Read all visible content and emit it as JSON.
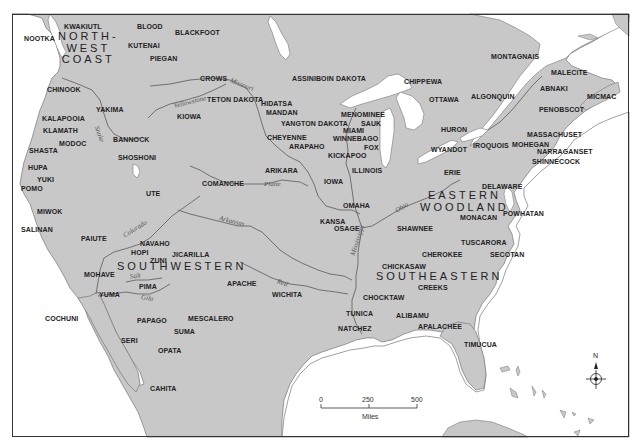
{
  "map": {
    "colors": {
      "land": "#c8c8c8",
      "water": "#ffffff",
      "border": "#333333",
      "river": "#555555",
      "text": "#222222"
    },
    "regions": [
      {
        "id": "northwest-coast",
        "lines": [
          "NORTH-",
          "WEST",
          "COAST"
        ],
        "x": 58,
        "y": 31
      },
      {
        "id": "southwestern",
        "lines": [
          "SOUTHWESTERN"
        ],
        "x": 117,
        "y": 261
      },
      {
        "id": "eastern-woodland",
        "lines": [
          "EASTERN",
          "WOODLAND"
        ],
        "x": 420,
        "y": 190
      },
      {
        "id": "southeastern",
        "lines": [
          "SOUTHEASTERN"
        ],
        "x": 376,
        "y": 271
      }
    ],
    "tribes": [
      {
        "name": "NOOTKA",
        "x": 24,
        "y": 35
      },
      {
        "name": "KWAKIUTL",
        "x": 64,
        "y": 23
      },
      {
        "name": "BLOOD",
        "x": 137,
        "y": 23
      },
      {
        "name": "BLACKFOOT",
        "x": 175,
        "y": 29
      },
      {
        "name": "KUTENAI",
        "x": 128,
        "y": 42
      },
      {
        "name": "PIEGAN",
        "x": 150,
        "y": 55
      },
      {
        "name": "CHINOOK",
        "x": 47,
        "y": 86
      },
      {
        "name": "CROWS",
        "x": 200,
        "y": 75
      },
      {
        "name": "YAKIMA",
        "x": 96,
        "y": 106
      },
      {
        "name": "KIOWA",
        "x": 177,
        "y": 113
      },
      {
        "name": "KALAPOOIA",
        "x": 42,
        "y": 115
      },
      {
        "name": "KLAMATH",
        "x": 43,
        "y": 127
      },
      {
        "name": "BANNOCK",
        "x": 113,
        "y": 136
      },
      {
        "name": "MODOC",
        "x": 59,
        "y": 140
      },
      {
        "name": "SHASTA",
        "x": 29,
        "y": 147
      },
      {
        "name": "SHOSHONI",
        "x": 118,
        "y": 154
      },
      {
        "name": "HUPA",
        "x": 28,
        "y": 164
      },
      {
        "name": "YUKI",
        "x": 37,
        "y": 176
      },
      {
        "name": "POMO",
        "x": 21,
        "y": 185
      },
      {
        "name": "UTE",
        "x": 146,
        "y": 190
      },
      {
        "name": "MIWOK",
        "x": 37,
        "y": 208
      },
      {
        "name": "SALINAN",
        "x": 21,
        "y": 226
      },
      {
        "name": "PAIUTE",
        "x": 81,
        "y": 235
      },
      {
        "name": "NAVAHO",
        "x": 140,
        "y": 240
      },
      {
        "name": "HOPI",
        "x": 131,
        "y": 249
      },
      {
        "name": "JICARILLA",
        "x": 172,
        "y": 251
      },
      {
        "name": "ZUNI",
        "x": 150,
        "y": 257
      },
      {
        "name": "MOHAVE",
        "x": 84,
        "y": 271
      },
      {
        "name": "PIMA",
        "x": 139,
        "y": 283
      },
      {
        "name": "YUMA",
        "x": 99,
        "y": 291
      },
      {
        "name": "COCHUNI",
        "x": 45,
        "y": 315
      },
      {
        "name": "PAPAGO",
        "x": 137,
        "y": 317
      },
      {
        "name": "SUMA",
        "x": 174,
        "y": 328
      },
      {
        "name": "SERI",
        "x": 121,
        "y": 337
      },
      {
        "name": "OPATA",
        "x": 158,
        "y": 347
      },
      {
        "name": "CAHITA",
        "x": 150,
        "y": 385
      },
      {
        "name": "MESCALERO",
        "x": 188,
        "y": 315
      },
      {
        "name": "APACHE",
        "x": 227,
        "y": 280
      },
      {
        "name": "WICHITA",
        "x": 272,
        "y": 291
      },
      {
        "name": "TETON DAKOTA",
        "x": 207,
        "y": 96
      },
      {
        "name": "ASSINIBOIN DAKOTA",
        "x": 292,
        "y": 75
      },
      {
        "name": "HIDATSA",
        "x": 261,
        "y": 100
      },
      {
        "name": "MANDAN",
        "x": 266,
        "y": 109
      },
      {
        "name": "CHEYENNE",
        "x": 267,
        "y": 134
      },
      {
        "name": "YANGTON DAKOTA",
        "x": 281,
        "y": 120
      },
      {
        "name": "ARAPAHO",
        "x": 289,
        "y": 143
      },
      {
        "name": "ARIKARA",
        "x": 265,
        "y": 167
      },
      {
        "name": "COMANCHE",
        "x": 202,
        "y": 180
      },
      {
        "name": "IOWA",
        "x": 324,
        "y": 178
      },
      {
        "name": "KICKAPOO",
        "x": 328,
        "y": 152
      },
      {
        "name": "ILLINOIS",
        "x": 352,
        "y": 167
      },
      {
        "name": "OMAHA",
        "x": 343,
        "y": 202
      },
      {
        "name": "KANSA",
        "x": 320,
        "y": 218
      },
      {
        "name": "OSAGE",
        "x": 334,
        "y": 225
      },
      {
        "name": "MENOMINEE",
        "x": 341,
        "y": 111
      },
      {
        "name": "SAUK",
        "x": 361,
        "y": 120
      },
      {
        "name": "MIAMI",
        "x": 343,
        "y": 127
      },
      {
        "name": "WINNEBAGO",
        "x": 333,
        "y": 135
      },
      {
        "name": "FOX",
        "x": 364,
        "y": 144
      },
      {
        "name": "CHIPPEWA",
        "x": 404,
        "y": 78
      },
      {
        "name": "OTTAWA",
        "x": 429,
        "y": 96
      },
      {
        "name": "HURON",
        "x": 441,
        "y": 126
      },
      {
        "name": "WYANDOT",
        "x": 431,
        "y": 146
      },
      {
        "name": "ERIE",
        "x": 444,
        "y": 169
      },
      {
        "name": "IROQUOIS",
        "x": 473,
        "y": 142
      },
      {
        "name": "ALGONQUIN",
        "x": 471,
        "y": 93
      },
      {
        "name": "MONTAGNAIS",
        "x": 491,
        "y": 53
      },
      {
        "name": "MALECITE",
        "x": 551,
        "y": 69
      },
      {
        "name": "ABNAKI",
        "x": 540,
        "y": 85
      },
      {
        "name": "MICMAC",
        "x": 587,
        "y": 93
      },
      {
        "name": "PENOBSCOT",
        "x": 539,
        "y": 106
      },
      {
        "name": "MASSACHUSET",
        "x": 527,
        "y": 131
      },
      {
        "name": "MOHEGAN",
        "x": 512,
        "y": 141
      },
      {
        "name": "NARRAGANSET",
        "x": 537,
        "y": 148
      },
      {
        "name": "SHINNECOCK",
        "x": 532,
        "y": 158
      },
      {
        "name": "DELAWARE",
        "x": 482,
        "y": 183
      },
      {
        "name": "POWHATAN",
        "x": 503,
        "y": 210
      },
      {
        "name": "MONACAN",
        "x": 460,
        "y": 214
      },
      {
        "name": "SHAWNEE",
        "x": 397,
        "y": 225
      },
      {
        "name": "TUSCARORA",
        "x": 461,
        "y": 239
      },
      {
        "name": "CHEROKEE",
        "x": 422,
        "y": 251
      },
      {
        "name": "SECOTAN",
        "x": 490,
        "y": 251
      },
      {
        "name": "CHICKASAW",
        "x": 382,
        "y": 263
      },
      {
        "name": "CREEKS",
        "x": 418,
        "y": 284
      },
      {
        "name": "CHOCKTAW",
        "x": 363,
        "y": 294
      },
      {
        "name": "TUNICA",
        "x": 346,
        "y": 310
      },
      {
        "name": "ALIBAMU",
        "x": 396,
        "y": 312
      },
      {
        "name": "APALACHEE",
        "x": 418,
        "y": 323
      },
      {
        "name": "NATCHEZ",
        "x": 338,
        "y": 325
      },
      {
        "name": "TIMUCUA",
        "x": 464,
        "y": 341
      }
    ],
    "rivers": [
      {
        "name": "Missouri",
        "x": 230,
        "y": 77,
        "rotate": 22
      },
      {
        "name": "Yellowstone",
        "x": 174,
        "y": 103,
        "rotate": -14
      },
      {
        "name": "Snake",
        "x": 96,
        "y": 123,
        "rotate": 70
      },
      {
        "name": "Platte",
        "x": 264,
        "y": 181,
        "rotate": 0
      },
      {
        "name": "Arkansas",
        "x": 219,
        "y": 215,
        "rotate": 14
      },
      {
        "name": "Colorado",
        "x": 124,
        "y": 233,
        "rotate": -32
      },
      {
        "name": "Salt",
        "x": 130,
        "y": 274,
        "rotate": -10
      },
      {
        "name": "Gila",
        "x": 141,
        "y": 294,
        "rotate": 10
      },
      {
        "name": "Red",
        "x": 277,
        "y": 278,
        "rotate": 20
      },
      {
        "name": "Ohio",
        "x": 396,
        "y": 208,
        "rotate": -30
      },
      {
        "name": "Mississippi",
        "x": 353,
        "y": 252,
        "rotate": -72
      }
    ],
    "scale_bar": {
      "ticks": [
        "0",
        "250",
        "500"
      ],
      "unit": "Miles"
    },
    "compass": {
      "north_label": "N"
    }
  }
}
